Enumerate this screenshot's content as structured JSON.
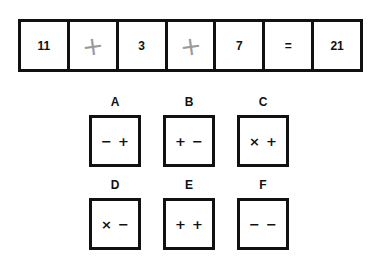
{
  "equation": {
    "cells": [
      {
        "value": "11",
        "style": "printed"
      },
      {
        "value": "+",
        "style": "pencil"
      },
      {
        "value": "3",
        "style": "printed"
      },
      {
        "value": "+",
        "style": "pencil"
      },
      {
        "value": "7",
        "style": "printed"
      },
      {
        "value": "=",
        "style": "printed"
      },
      {
        "value": "21",
        "style": "printed"
      }
    ]
  },
  "choices": [
    {
      "label": "A",
      "symbols": [
        "−",
        "+"
      ]
    },
    {
      "label": "B",
      "symbols": [
        "+",
        "−"
      ]
    },
    {
      "label": "C",
      "symbols": [
        "×",
        "+"
      ]
    },
    {
      "label": "D",
      "symbols": [
        "×",
        "−"
      ]
    },
    {
      "label": "E",
      "symbols": [
        "+",
        "+"
      ]
    },
    {
      "label": "F",
      "symbols": [
        "−",
        "−"
      ]
    }
  ]
}
